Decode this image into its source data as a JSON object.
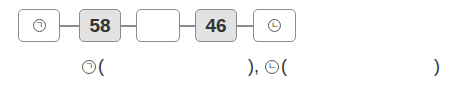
{
  "chain": {
    "boxes": [
      {
        "label": "ㄱ",
        "type": "blank-marked"
      },
      {
        "value": "58",
        "type": "given"
      },
      {
        "value": "",
        "type": "empty"
      },
      {
        "value": "46",
        "type": "given"
      },
      {
        "label": "ㄴ",
        "type": "blank-marked"
      }
    ]
  },
  "answers": {
    "a_label": "ㄱ",
    "a_open": "(",
    "a_close": "),",
    "b_label": "ㄴ",
    "b_open": "(",
    "b_close": ")"
  }
}
